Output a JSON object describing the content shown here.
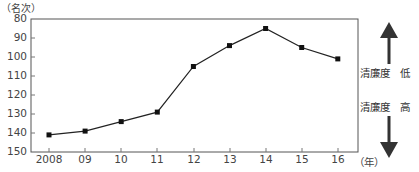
{
  "chart_data": {
    "type": "line",
    "title": "",
    "ylabel": "（名次）",
    "xlabel": "（年）",
    "categories": [
      "2008",
      "09",
      "10",
      "11",
      "12",
      "13",
      "14",
      "15",
      "16"
    ],
    "x": [
      2008,
      2009,
      2010,
      2011,
      2012,
      2013,
      2014,
      2015,
      2016
    ],
    "series": [
      {
        "name": "清廉度排名",
        "values": [
          141,
          139,
          134,
          129,
          105,
          94,
          85,
          95,
          101
        ]
      }
    ],
    "ylim": [
      150,
      80
    ],
    "y_inverted": true,
    "yticks": [
      80,
      90,
      100,
      110,
      120,
      130,
      140,
      150
    ],
    "grid": false,
    "annotations": [
      {
        "text": "清廉度　低",
        "direction": "up"
      },
      {
        "text": "清廉度　高",
        "direction": "down"
      }
    ]
  },
  "labels": {
    "y_unit": "（名次）",
    "x_unit": "（年）",
    "low": "清廉度　低",
    "high": "清廉度　高",
    "yticks": [
      "80",
      "90",
      "100",
      "110",
      "120",
      "130",
      "140",
      "150"
    ],
    "xticks": [
      "2008",
      "09",
      "10",
      "11",
      "12",
      "13",
      "14",
      "15",
      "16"
    ]
  }
}
